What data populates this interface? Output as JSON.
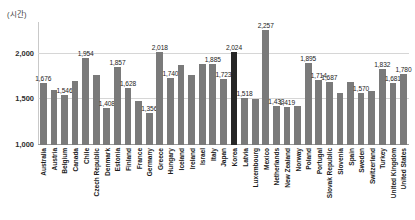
{
  "chart_data": {
    "type": "bar",
    "title": "",
    "subtitle": "",
    "xlabel": "",
    "ylabel": "(시간)",
    "unit_caption": "(시간)",
    "ylim": [
      1000,
      2350
    ],
    "yticks": [
      "1,000",
      "1,500",
      "2,000"
    ],
    "ytick_values": [
      1000,
      1500,
      2000
    ],
    "grid": true,
    "legend": "none",
    "highlight_category": "Korea",
    "highlight_color": "#262626",
    "bar_color": "#7a7a7a",
    "categories": [
      "Australia",
      "Austria",
      "Belgium",
      "Canada",
      "Chile",
      "Czech Republic",
      "Denmark",
      "Estonia",
      "Finland",
      "France",
      "Germany",
      "Greece",
      "Hungary",
      "Iceland",
      "Ireland",
      "Israel",
      "Italy",
      "Japan",
      "Korea",
      "Latvia",
      "Luxembourg",
      "Mexico",
      "Netherlands",
      "New Zealand",
      "Norway",
      "Poland",
      "Portugal",
      "Slovak Republic",
      "Slovenia",
      "Spain",
      "Sweden",
      "Switzerland",
      "Turkey",
      "United Kingdom",
      "United States"
    ],
    "values": [
      1676,
      1601,
      1546,
      1703,
      1954,
      1770,
      1408,
      1857,
      1628,
      1482,
      1356,
      2018,
      1740,
      1883,
      1772,
      1889,
      1885,
      1723,
      2024,
      1518,
      1506,
      2257,
      1433,
      1419,
      1424,
      1895,
      1714,
      1687,
      1570,
      1687,
      1570,
      1590,
      1832,
      1681,
      1780
    ],
    "labels": [
      "1,676",
      "",
      "1,546",
      "",
      "1,954",
      "",
      "1,408",
      "1,857",
      "1,628",
      "",
      "1,356",
      "2,018",
      "1,740",
      "",
      "",
      "",
      "1,885",
      "1,723",
      "2,024",
      "1,518",
      "",
      "2,257",
      "1,433",
      "1,419",
      "",
      "1,895",
      "1,714",
      "1,687",
      "",
      "",
      "1,570",
      "",
      "1,832",
      "1,681",
      "1,780"
    ]
  }
}
